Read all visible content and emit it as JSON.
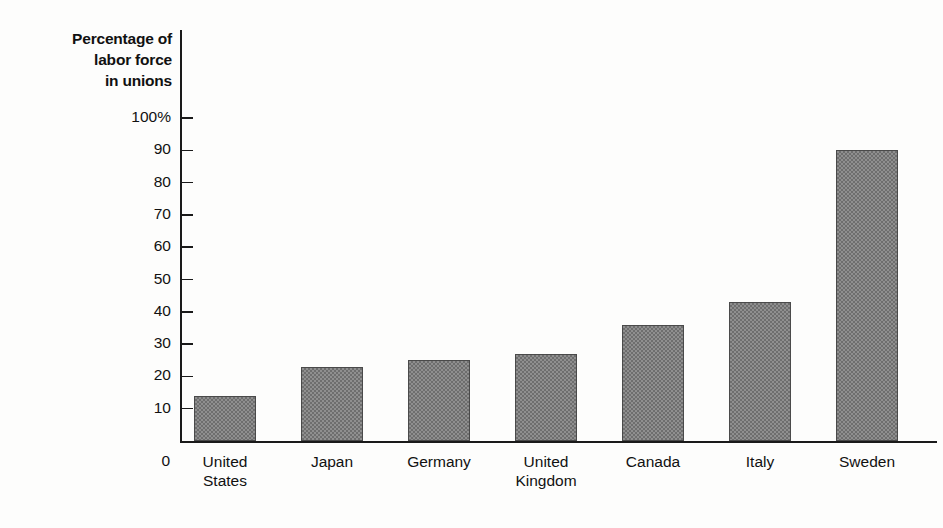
{
  "chart_data": {
    "type": "bar",
    "title": "",
    "ylabel": "Percentage of labor force in unions",
    "xlabel": "",
    "ylim": [
      0,
      100
    ],
    "ytick_values": [
      0,
      10,
      20,
      30,
      40,
      50,
      60,
      70,
      80,
      90,
      100
    ],
    "ytick_labels": [
      "0",
      "10",
      "20",
      "30",
      "40",
      "50",
      "60",
      "70",
      "80",
      "90",
      "100%"
    ],
    "grid": false,
    "legend": "none",
    "categories": [
      "United States",
      "Japan",
      "Germany",
      "United Kingdom",
      "Canada",
      "Italy",
      "Sweden"
    ],
    "values": [
      14,
      23,
      25,
      27,
      36,
      43,
      90
    ],
    "bar_fill_color": "#8f8f8f",
    "bar_edge_color": "#4a4a4a",
    "axis_color": "#1a1a1a",
    "background_color": "#fdfdfc"
  },
  "axis_title": {
    "line1": "Percentage of",
    "line2": "labor force",
    "line3": "in unions"
  },
  "category_labels": [
    {
      "line1": "United",
      "line2": "States"
    },
    {
      "line1": "Japan",
      "line2": ""
    },
    {
      "line1": "Germany",
      "line2": ""
    },
    {
      "line1": "United",
      "line2": "Kingdom"
    },
    {
      "line1": "Canada",
      "line2": ""
    },
    {
      "line1": "Italy",
      "line2": ""
    },
    {
      "line1": "Sweden",
      "line2": ""
    }
  ],
  "zero_label": "0"
}
